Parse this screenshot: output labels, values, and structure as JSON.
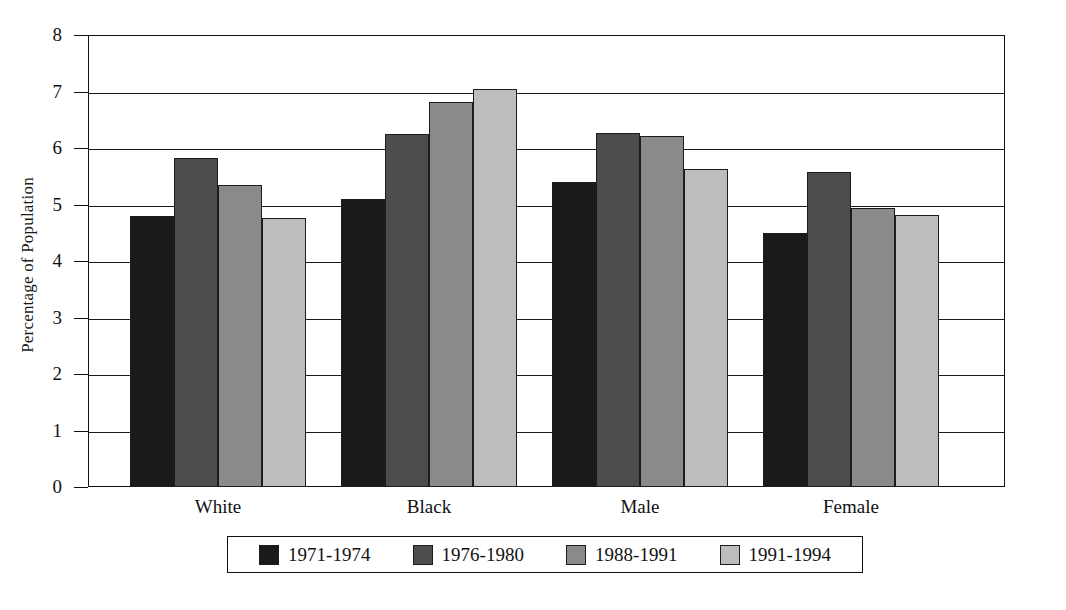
{
  "chart_data": {
    "type": "bar",
    "title": "",
    "xlabel": "",
    "ylabel": "Percentage of Population",
    "ylim": [
      0,
      8
    ],
    "ytick_labels": [
      "8",
      "7",
      "6",
      "5",
      "4",
      "3",
      "2",
      "1",
      "0"
    ],
    "ytick_values": [
      8,
      7,
      6,
      5,
      4,
      3,
      2,
      1,
      0
    ],
    "grid": true,
    "legend_position": "bottom",
    "categories": [
      "White",
      "Black",
      "Male",
      "Female"
    ],
    "series": [
      {
        "name": "1971-1974",
        "color": "#1a1a1a",
        "values": [
          4.8,
          5.1,
          5.4,
          4.5
        ]
      },
      {
        "name": "1976-1980",
        "color": "#4d4d4d",
        "values": [
          5.83,
          6.25,
          6.27,
          5.58
        ]
      },
      {
        "name": "1988-1991",
        "color": "#8a8a8a",
        "values": [
          5.34,
          6.82,
          6.21,
          4.94
        ]
      },
      {
        "name": "1991-1994",
        "color": "#bdbdbd",
        "values": [
          4.77,
          7.05,
          5.62,
          4.81
        ]
      }
    ]
  },
  "axis": {
    "y_title": "Percentage of Population"
  },
  "colors": {
    "axis": "#111111",
    "grid": "#1a1a1a",
    "background": "#ffffff"
  }
}
